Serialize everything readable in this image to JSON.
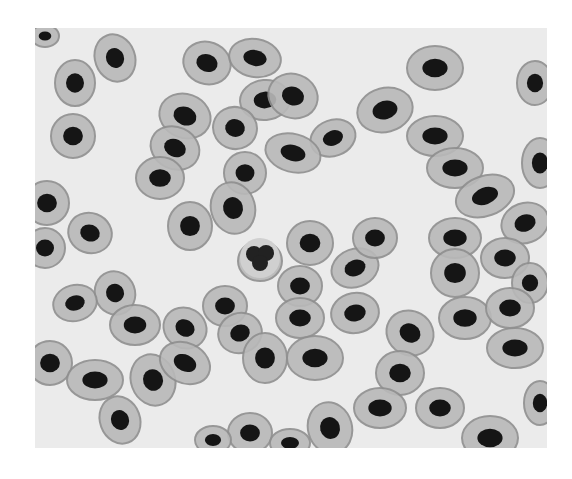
{
  "image": {
    "subject": "micrograph of nucleated red blood cells (erythrocytes)",
    "style": "grayscale photomicrograph on white page",
    "colors": {
      "page": "#ffffff",
      "background": "#ebebeb",
      "cytoplasm": "#b9b9b9",
      "cytoplasm_rim": "#8f8f8f",
      "nucleus": "#151515"
    },
    "cells": [
      {
        "cx": 10,
        "cy": 8,
        "rx": 14,
        "ry": 11,
        "rot": 0
      },
      {
        "cx": 80,
        "cy": 30,
        "rx": 20,
        "ry": 24,
        "rot": -20
      },
      {
        "cx": 40,
        "cy": 55,
        "rx": 20,
        "ry": 23,
        "rot": 0
      },
      {
        "cx": 172,
        "cy": 35,
        "rx": 24,
        "ry": 21,
        "rot": 20
      },
      {
        "cx": 220,
        "cy": 30,
        "rx": 26,
        "ry": 19,
        "rot": 10
      },
      {
        "cx": 230,
        "cy": 72,
        "rx": 25,
        "ry": 20,
        "rot": -5
      },
      {
        "cx": 150,
        "cy": 88,
        "rx": 26,
        "ry": 22,
        "rot": 20
      },
      {
        "cx": 200,
        "cy": 100,
        "rx": 22,
        "ry": 21,
        "rot": 15
      },
      {
        "cx": 38,
        "cy": 108,
        "rx": 22,
        "ry": 22,
        "rot": 0
      },
      {
        "cx": 140,
        "cy": 120,
        "rx": 25,
        "ry": 21,
        "rot": 25
      },
      {
        "cx": 125,
        "cy": 150,
        "rx": 24,
        "ry": 21,
        "rot": 0
      },
      {
        "cx": 210,
        "cy": 145,
        "rx": 21,
        "ry": 21,
        "rot": 0
      },
      {
        "cx": 198,
        "cy": 180,
        "rx": 22,
        "ry": 26,
        "rot": -15
      },
      {
        "cx": 258,
        "cy": 68,
        "rx": 25,
        "ry": 22,
        "rot": 20
      },
      {
        "cx": 298,
        "cy": 110,
        "rx": 23,
        "ry": 18,
        "rot": -20
      },
      {
        "cx": 258,
        "cy": 125,
        "rx": 28,
        "ry": 19,
        "rot": 15
      },
      {
        "cx": 350,
        "cy": 82,
        "rx": 28,
        "ry": 22,
        "rot": -15
      },
      {
        "cx": 400,
        "cy": 40,
        "rx": 28,
        "ry": 22,
        "rot": 0
      },
      {
        "cx": 400,
        "cy": 108,
        "rx": 28,
        "ry": 20,
        "rot": 0
      },
      {
        "cx": 420,
        "cy": 140,
        "rx": 28,
        "ry": 20,
        "rot": 0
      },
      {
        "cx": 450,
        "cy": 168,
        "rx": 30,
        "ry": 20,
        "rot": -20
      },
      {
        "cx": 500,
        "cy": 55,
        "rx": 18,
        "ry": 22,
        "rot": 0
      },
      {
        "cx": 505,
        "cy": 135,
        "rx": 18,
        "ry": 25,
        "rot": 0
      },
      {
        "cx": 490,
        "cy": 195,
        "rx": 24,
        "ry": 20,
        "rot": -20
      },
      {
        "cx": 12,
        "cy": 175,
        "rx": 22,
        "ry": 22,
        "rot": 0
      },
      {
        "cx": 10,
        "cy": 220,
        "rx": 20,
        "ry": 20,
        "rot": 0
      },
      {
        "cx": 55,
        "cy": 205,
        "rx": 22,
        "ry": 20,
        "rot": 20
      },
      {
        "cx": 155,
        "cy": 198,
        "rx": 22,
        "ry": 24,
        "rot": 0
      },
      {
        "cx": 225,
        "cy": 233,
        "rx": 22,
        "ry": 20,
        "rot": 0
      },
      {
        "cx": 275,
        "cy": 215,
        "rx": 23,
        "ry": 22,
        "rot": 0
      },
      {
        "cx": 320,
        "cy": 240,
        "rx": 24,
        "ry": 19,
        "rot": -20
      },
      {
        "cx": 340,
        "cy": 210,
        "rx": 22,
        "ry": 20,
        "rot": 0
      },
      {
        "cx": 265,
        "cy": 258,
        "rx": 22,
        "ry": 20,
        "rot": 0
      },
      {
        "cx": 420,
        "cy": 210,
        "rx": 26,
        "ry": 20,
        "rot": 0
      },
      {
        "cx": 420,
        "cy": 245,
        "rx": 24,
        "ry": 24,
        "rot": 0
      },
      {
        "cx": 470,
        "cy": 230,
        "rx": 24,
        "ry": 20,
        "rot": 0
      },
      {
        "cx": 495,
        "cy": 255,
        "rx": 18,
        "ry": 20,
        "rot": 0
      },
      {
        "cx": 80,
        "cy": 265,
        "rx": 20,
        "ry": 22,
        "rot": -20
      },
      {
        "cx": 40,
        "cy": 275,
        "rx": 22,
        "ry": 18,
        "rot": -15
      },
      {
        "cx": 100,
        "cy": 297,
        "rx": 25,
        "ry": 20,
        "rot": 0
      },
      {
        "cx": 150,
        "cy": 300,
        "rx": 22,
        "ry": 20,
        "rot": 30
      },
      {
        "cx": 190,
        "cy": 278,
        "rx": 22,
        "ry": 20,
        "rot": 0
      },
      {
        "cx": 205,
        "cy": 305,
        "rx": 22,
        "ry": 20,
        "rot": -20
      },
      {
        "cx": 265,
        "cy": 290,
        "rx": 24,
        "ry": 20,
        "rot": 0
      },
      {
        "cx": 320,
        "cy": 285,
        "rx": 24,
        "ry": 20,
        "rot": -10
      },
      {
        "cx": 375,
        "cy": 305,
        "rx": 24,
        "ry": 22,
        "rot": 30
      },
      {
        "cx": 430,
        "cy": 290,
        "rx": 26,
        "ry": 21,
        "rot": 0
      },
      {
        "cx": 475,
        "cy": 280,
        "rx": 24,
        "ry": 20,
        "rot": 0
      },
      {
        "cx": 480,
        "cy": 320,
        "rx": 28,
        "ry": 20,
        "rot": 0
      },
      {
        "cx": 15,
        "cy": 335,
        "rx": 22,
        "ry": 22,
        "rot": 0
      },
      {
        "cx": 60,
        "cy": 352,
        "rx": 28,
        "ry": 20,
        "rot": 0
      },
      {
        "cx": 118,
        "cy": 352,
        "rx": 22,
        "ry": 26,
        "rot": -20
      },
      {
        "cx": 150,
        "cy": 335,
        "rx": 26,
        "ry": 20,
        "rot": 25
      },
      {
        "cx": 230,
        "cy": 330,
        "rx": 22,
        "ry": 25,
        "rot": 0
      },
      {
        "cx": 280,
        "cy": 330,
        "rx": 28,
        "ry": 22,
        "rot": 0
      },
      {
        "cx": 365,
        "cy": 345,
        "rx": 24,
        "ry": 22,
        "rot": 0
      },
      {
        "cx": 405,
        "cy": 380,
        "rx": 24,
        "ry": 20,
        "rot": 0
      },
      {
        "cx": 295,
        "cy": 400,
        "rx": 22,
        "ry": 26,
        "rot": -15
      },
      {
        "cx": 345,
        "cy": 380,
        "rx": 26,
        "ry": 20,
        "rot": 0
      },
      {
        "cx": 455,
        "cy": 410,
        "rx": 28,
        "ry": 22,
        "rot": 0
      },
      {
        "cx": 505,
        "cy": 375,
        "rx": 16,
        "ry": 22,
        "rot": 0
      },
      {
        "cx": 85,
        "cy": 392,
        "rx": 20,
        "ry": 24,
        "rot": -20
      },
      {
        "cx": 215,
        "cy": 405,
        "rx": 22,
        "ry": 20,
        "rot": 0
      },
      {
        "cx": 178,
        "cy": 412,
        "rx": 18,
        "ry": 14,
        "rot": 0
      },
      {
        "cx": 255,
        "cy": 415,
        "rx": 20,
        "ry": 14,
        "rot": 0
      }
    ],
    "leukocyte": {
      "cx": 225,
      "cy": 230,
      "r": 20
    }
  }
}
